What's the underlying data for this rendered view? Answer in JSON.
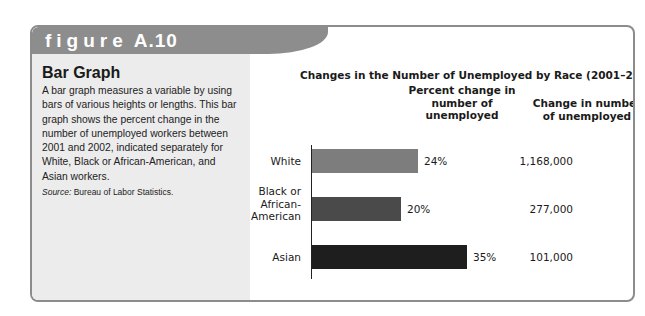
{
  "figure": {
    "label_word": "figure",
    "label_number": "A.10"
  },
  "sidebar": {
    "title": "Bar Graph",
    "description": "A bar graph measures a variable by using bars of various heights or lengths. This bar graph shows the percent change in the number of unemployed workers between 2001 and 2002, indicated separately for White, Black or African-American, and Asian workers.",
    "source_label": "Source:",
    "source_text": "Bureau of Labor Statistics."
  },
  "chart_data": {
    "type": "bar",
    "orientation": "horizontal",
    "title": "Changes in the Number of Unemployed by Race (2001–2002)",
    "column_headers": {
      "percent": "Percent change in number of unemployed",
      "number": "Change in number of unemployed"
    },
    "categories": [
      "White",
      "Black or African-American",
      "Asian"
    ],
    "category_lines": [
      [
        "White"
      ],
      [
        "Black or",
        "African-",
        "American"
      ],
      [
        "Asian"
      ]
    ],
    "values": [
      24,
      20,
      35
    ],
    "value_labels": [
      "24%",
      "20%",
      "35%"
    ],
    "change_in_number": [
      "1,168,000",
      "277,000",
      "101,000"
    ],
    "bar_colors": [
      "#7d7d7d",
      "#4a4a4a",
      "#1e1e1e"
    ],
    "xlabel": "",
    "ylabel": "",
    "grid": false,
    "legend": null
  }
}
